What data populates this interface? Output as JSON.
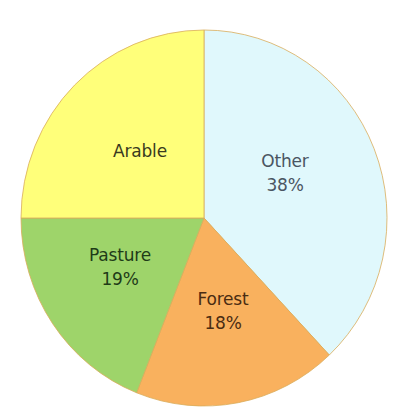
{
  "chart_data": {
    "type": "pie",
    "title": "",
    "start_angle_deg": 0,
    "direction": "clockwise",
    "slices": [
      {
        "label": "Other",
        "value": 38,
        "value_label": "38%",
        "color": "#e0f8fc",
        "text_color": "#4a5562",
        "label_pos": {
          "x": 285,
          "y": 149
        }
      },
      {
        "label": "Forest",
        "value": 18,
        "value_label": "18%",
        "color": "#f9b15e",
        "text_color": "#4a2c12",
        "label_pos": {
          "x": 223,
          "y": 287
        }
      },
      {
        "label": "Pasture",
        "value": 19,
        "value_label": "19%",
        "color": "#9ed46a",
        "text_color": "#1f3b18",
        "label_pos": {
          "x": 120,
          "y": 243
        }
      },
      {
        "label": "Arable",
        "value": 25,
        "value_label": "",
        "color": "#ffff7a",
        "text_color": "#3a3a1e",
        "label_pos": {
          "x": 140,
          "y": 139
        }
      }
    ],
    "categories": [
      "Other",
      "Forest",
      "Pasture",
      "Arable"
    ],
    "values": [
      38,
      18,
      19,
      25
    ],
    "unit": "%",
    "legend": "none"
  },
  "geometry": {
    "cx": 204,
    "cy": 218,
    "rx": 183,
    "ry": 188
  }
}
